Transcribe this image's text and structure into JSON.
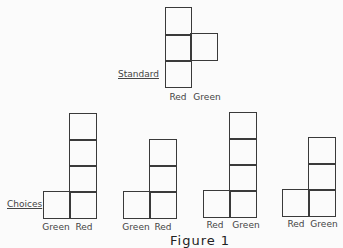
{
  "standard": {
    "label": "Standard",
    "bar_labels": [
      "Red",
      "Green"
    ],
    "heights": [
      3,
      1
    ]
  },
  "choices": {
    "label": "Choices",
    "items": [
      {
        "bar_labels": [
          "Green",
          "Red"
        ],
        "heights": [
          1,
          4
        ]
      },
      {
        "bar_labels": [
          "Green",
          "Red"
        ],
        "heights": [
          1,
          3
        ]
      },
      {
        "bar_labels": [
          "Red",
          "Green"
        ],
        "heights": [
          1,
          4
        ]
      },
      {
        "bar_labels": [
          "Red",
          "Green"
        ],
        "heights": [
          1,
          3
        ]
      }
    ]
  },
  "caption": "Figure 1"
}
